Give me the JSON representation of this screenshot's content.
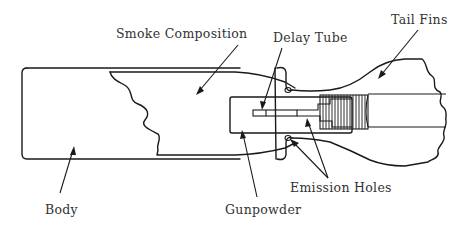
{
  "diagram": {
    "labels": {
      "smoke_composition": "Smoke Composition",
      "delay_tube": "Delay Tube",
      "tail_fins": "Tail Fins",
      "body": "Body",
      "gunpowder": "Gunpowder",
      "emission_holes": "Emission Holes"
    },
    "colors": {
      "line": "#1a1a1a",
      "text": "#333333",
      "background": "#ffffff"
    }
  }
}
